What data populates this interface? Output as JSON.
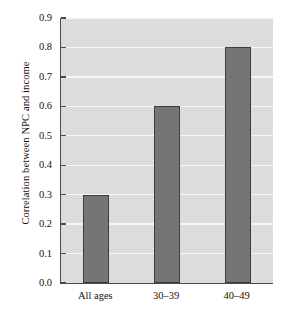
{
  "chart_data": {
    "type": "bar",
    "title": "",
    "xlabel": "",
    "ylabel": "Correlation between NPC and income",
    "categories": [
      "All ages",
      "30–39",
      "40–49"
    ],
    "values": [
      0.3,
      0.6,
      0.8
    ],
    "ylim": [
      0.0,
      0.9
    ],
    "ytick_labels": [
      "0.0",
      "0.1",
      "0.2",
      "0.3",
      "0.4",
      "0.5",
      "0.6",
      "0.7",
      "0.8",
      "0.9"
    ],
    "ytick_values": [
      0.0,
      0.1,
      0.2,
      0.3,
      0.4,
      0.5,
      0.6,
      0.7,
      0.8,
      0.9
    ],
    "grid": true,
    "legend": "none",
    "colors": {
      "bar_fill": "#757575",
      "bar_edge": "#3d3d3d",
      "plot_background": "#dcdcdc",
      "gridline": "#f7f7f7",
      "axis": "#4a4a4a",
      "text": "#111111",
      "figure_background": "#ffffff"
    }
  }
}
